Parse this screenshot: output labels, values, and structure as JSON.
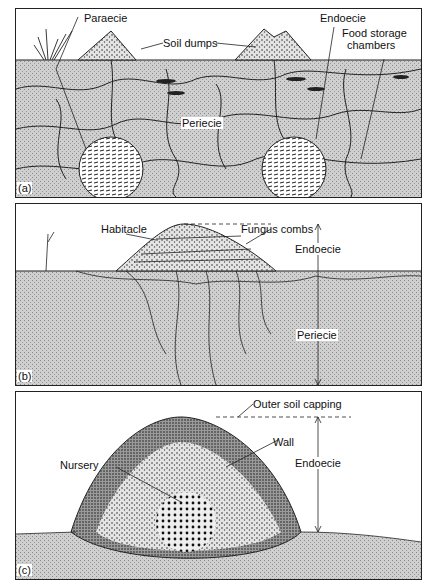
{
  "figure": {
    "panels": [
      {
        "id": "a",
        "panel_label": "(a)",
        "labels": {
          "paraecie": "Paraecie",
          "soil_dumps": "Soil dumps",
          "endoecie": "Endoecie",
          "food_storage_1": "Food storage",
          "food_storage_2": "chambers",
          "periecie": "Periecie"
        }
      },
      {
        "id": "b",
        "panel_label": "(b)",
        "labels": {
          "habitacle": "Habitacle",
          "fungus_combs": "Fungus combs",
          "endoecie": "Endoecie",
          "periecie": "Periecie"
        }
      },
      {
        "id": "c",
        "panel_label": "(c)",
        "labels": {
          "outer_soil_capping": "Outer soil capping",
          "wall": "Wall",
          "nursery": "Nursery",
          "endoecie": "Endoecie"
        }
      }
    ],
    "colors": {
      "soil": "#c9c9c9",
      "line": "#222222",
      "background": "#ffffff"
    }
  }
}
